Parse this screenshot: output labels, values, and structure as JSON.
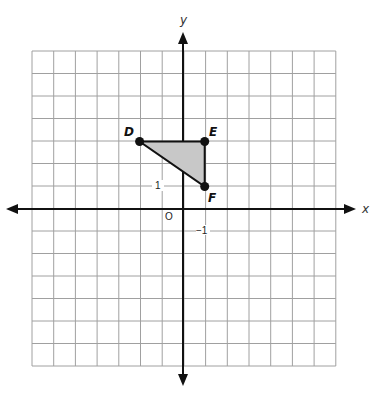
{
  "graph": {
    "x_axis_label": "x",
    "y_axis_label": "y",
    "origin_label": "O",
    "tick_labels": {
      "y_pos_1": "1",
      "y_neg_1": "−1"
    },
    "grid": {
      "x_min": -7,
      "x_max": 7,
      "y_min": -7,
      "y_max": 7
    },
    "colors": {
      "grid": "#a0a0a0",
      "axis": "#111111",
      "fill": "#c8c8c8",
      "edge": "#111111"
    }
  },
  "triangle": {
    "points": [
      {
        "label": "D",
        "x": -2,
        "y": 3
      },
      {
        "label": "E",
        "x": 1,
        "y": 3
      },
      {
        "label": "F",
        "x": 1,
        "y": 1
      }
    ]
  }
}
